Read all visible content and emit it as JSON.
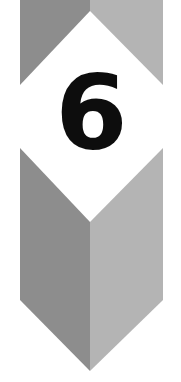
{
  "graphic": {
    "kind": "chapter-number-banner",
    "number": "6",
    "alt_text": "Chapter 6",
    "canvas": {
      "width": 181,
      "height": 382
    },
    "colors": {
      "background": "#ffffff",
      "band_left_gray": "#8d8d8d",
      "band_right_gray": "#b4b4b4",
      "diamond_fill": "#ffffff",
      "number_ink": "#0d0d0d"
    },
    "band": {
      "left_edge_x": 20,
      "right_edge_x": 163,
      "center_x": 90,
      "top_y": 0,
      "shoulder_y": 300,
      "point_y": 371
    },
    "diamond": {
      "top_apex_y": 11,
      "widest_y": 115,
      "bottom_apex_y": 222
    }
  }
}
